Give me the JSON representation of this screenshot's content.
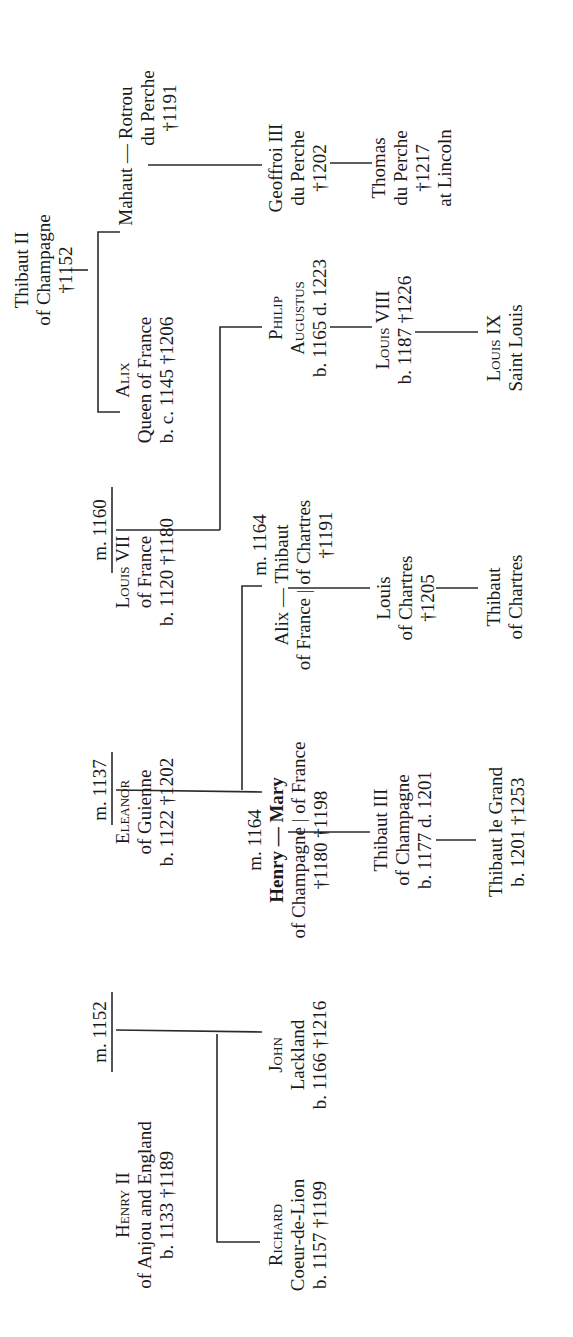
{
  "diagram": {
    "type": "genealogical-tree",
    "orientation": "rotated-90-ccw",
    "persons": {
      "thibaut_ii": {
        "lines": [
          "Thibaut II",
          "of Champagne",
          "†1152"
        ]
      },
      "mahaut_rotrou": {
        "lines": [
          "Mahaut — Rotrou",
          "du Perche",
          "†1191"
        ]
      },
      "geoffroi_iii": {
        "lines": [
          "Geoffroi III",
          "du Perche",
          "†1202"
        ]
      },
      "thomas": {
        "lines": [
          "Thomas",
          "du Perche",
          "†1217",
          "at Lincoln"
        ]
      },
      "alix_queen": {
        "lines": [
          "Alix",
          "Queen of France",
          "b. c. 1145 †1206"
        ]
      },
      "philip_augustus": {
        "lines": [
          "Philip",
          "Augustus",
          "b. 1165 d. 1223"
        ]
      },
      "louis_viii": {
        "lines": [
          "Louis VIII",
          "b. 1187 †1226"
        ]
      },
      "louis_ix": {
        "lines": [
          "Louis IX",
          "Saint Louis"
        ]
      },
      "louis_vii": {
        "lines": [
          "Louis VII",
          "of France",
          "b. 1120 †1180"
        ]
      },
      "alix_thibaut": {
        "lines": [
          "m. 1164",
          "Alix — Thibaut",
          "of France | of Chartres",
          "†1191"
        ]
      },
      "louis_chartres": {
        "lines": [
          "Louis",
          "of Chartres",
          "†1205"
        ]
      },
      "thibaut_chartres": {
        "lines": [
          "Thibaut",
          "of Chartres"
        ]
      },
      "eleanor": {
        "lines": [
          "Eleanor",
          "of Guienne",
          "b. 1122 †1202"
        ]
      },
      "henry_mary": {
        "lines": [
          "m. 1164",
          "Henry — Mary",
          "of Champagne | of France",
          "†1180   †1198"
        ]
      },
      "thibaut_iii": {
        "lines": [
          "Thibaut III",
          "of Champagne",
          "b. 1177 d. 1201"
        ]
      },
      "thibaut_le_grand": {
        "lines": [
          "Thibaut le Grand",
          "b. 1201 †1253"
        ]
      },
      "john": {
        "lines": [
          "John",
          "Lackland",
          "b. 1166 †1216"
        ]
      },
      "henry_ii": {
        "lines": [
          "Henry II",
          "of Anjou and England",
          "b. 1133 †1189"
        ]
      },
      "richard": {
        "lines": [
          "Richard",
          "Coeur-de-Lion",
          "b. 1157 †1199"
        ]
      }
    },
    "marriages": {
      "m1160": "m. 1160",
      "m1137": "m. 1137",
      "m1152": "m. 1152"
    }
  }
}
